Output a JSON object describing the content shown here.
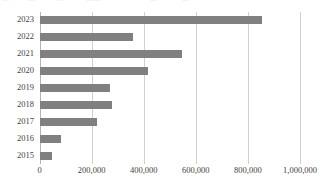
{
  "chart_data": {
    "type": "bar",
    "orientation": "horizontal",
    "title": "",
    "xlabel": "",
    "ylabel": "",
    "categories": [
      "2023",
      "2022",
      "2021",
      "2020",
      "2019",
      "2018",
      "2017",
      "2016",
      "2015"
    ],
    "values": [
      854000,
      359000,
      547000,
      416000,
      271000,
      278000,
      221000,
      83000,
      48000
    ],
    "series": [
      {
        "name": "",
        "values": [
          854000,
          359000,
          547000,
          416000,
          271000,
          278000,
          221000,
          83000,
          48000
        ]
      }
    ],
    "xlim": [
      0,
      1000000
    ],
    "xticks": [
      0,
      200000,
      400000,
      600000,
      800000,
      1000000
    ],
    "xtick_labels": [
      "0",
      "200,000",
      "400,000",
      "600,000",
      "800,000",
      "1,000,000"
    ],
    "grid": true,
    "grid_axis": "x",
    "legend": false,
    "legend_position": "none",
    "bar_color": "#808080",
    "gridline_color": "#d0d0d0",
    "axis_color": "#b4b4b4",
    "text_color": "#3f3f3f",
    "background": "#ffffff"
  },
  "clipped_top_text": {
    "note": "illegible clipped glyph fragments along the top scan edge",
    "fragments": [
      "—",
      "—",
      "—",
      "——",
      "·",
      "—",
      "—",
      "·"
    ]
  }
}
